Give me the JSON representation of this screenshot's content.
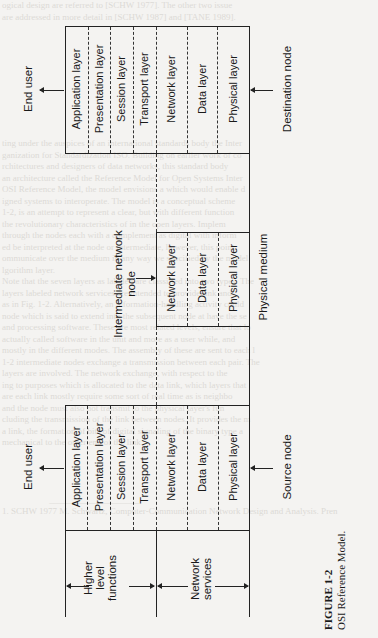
{
  "figure": {
    "number": "FIGURE 1-2",
    "title": "OSI Reference Model."
  },
  "destination_node": {
    "label": "Destination node",
    "end_user": "End user",
    "layers": [
      "Application layer",
      "Presentation layer",
      "Session layer",
      "Transport layer",
      "Network layer",
      "Data layer",
      "Physical layer"
    ]
  },
  "intermediate_node": {
    "label": "Intermediate network node",
    "layers": [
      "Network layer",
      "Data layer",
      "Physical layer"
    ]
  },
  "source_node": {
    "label": "Source node",
    "end_user": "End user",
    "layers": [
      "Application layer",
      "Presentation layer",
      "Session layer",
      "Transport layer",
      "Network layer",
      "Data layer",
      "Physical layer"
    ]
  },
  "physical_medium": "Physical medium",
  "brackets": {
    "higher": "Higher level functions",
    "network": "Network services"
  },
  "colors": {
    "ink": "#1a1a1a",
    "paper": "#f4f3f1",
    "bleed": "#dcdad6"
  }
}
